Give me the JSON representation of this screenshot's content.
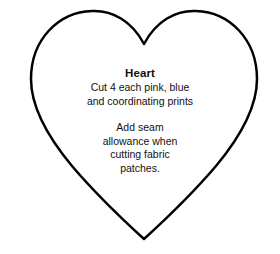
{
  "canvas": {
    "width": 280,
    "height": 254,
    "background_color": "#ffffff"
  },
  "shape": {
    "name": "heart",
    "outline_color": "#000000",
    "fill_color": "#ffffff",
    "stroke_width": 2.5
  },
  "pattern": {
    "title": "Heart",
    "instructions": {
      "cut_note": {
        "lines": [
          "Cut 4 each pink, blue",
          "and coordinating prints"
        ]
      },
      "seam_note": {
        "lines": [
          "Add seam",
          "allowance when",
          "cutting fabric",
          "patches."
        ]
      }
    },
    "text_color": "#111111"
  }
}
